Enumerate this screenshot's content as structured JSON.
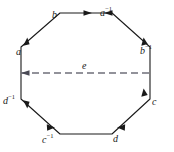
{
  "figure": {
    "name": "octagon-edge-identification-diagram",
    "shape": "regular-octagon",
    "stroke_color": "#1a1a1a",
    "diagonal_color": "#6f6f7a",
    "background_color": "#ffffff"
  },
  "edges": [
    {
      "id": "edge-b",
      "base": "b",
      "exponent": "",
      "position": "top-left",
      "label_x": 52,
      "label_y": 10,
      "arrow_direction": "clockwise"
    },
    {
      "id": "edge-a-inverse",
      "base": "a",
      "exponent": "−1",
      "position": "top-right",
      "label_x": 100,
      "label_y": 8,
      "arrow_direction": "counterclockwise"
    },
    {
      "id": "edge-a",
      "base": "a",
      "exponent": "",
      "position": "left-upper",
      "label_x": 16,
      "label_y": 47,
      "arrow_direction": "upward"
    },
    {
      "id": "edge-b-inverse",
      "base": "b",
      "exponent": "−1",
      "position": "right-upper",
      "label_x": 140,
      "label_y": 46,
      "arrow_direction": "upward"
    },
    {
      "id": "edge-d-inverse",
      "base": "d",
      "exponent": "−1",
      "position": "left-lower",
      "label_x": 3,
      "label_y": 96,
      "arrow_direction": "downward"
    },
    {
      "id": "edge-c",
      "base": "c",
      "exponent": "",
      "position": "right-lower",
      "label_x": 152,
      "label_y": 97,
      "arrow_direction": "upward"
    },
    {
      "id": "edge-c-inverse",
      "base": "c",
      "exponent": "−1",
      "position": "bottom-left",
      "label_x": 42,
      "label_y": 135,
      "arrow_direction": "clockwise"
    },
    {
      "id": "edge-d",
      "base": "d",
      "exponent": "",
      "position": "bottom-right",
      "label_x": 113,
      "label_y": 134,
      "arrow_direction": "counterclockwise"
    }
  ],
  "diagonal": {
    "id": "diagonal-e",
    "base": "e",
    "exponent": "",
    "label_x": 82,
    "label_y": 61,
    "style": "dashed",
    "arrow_direction": "leftward"
  }
}
